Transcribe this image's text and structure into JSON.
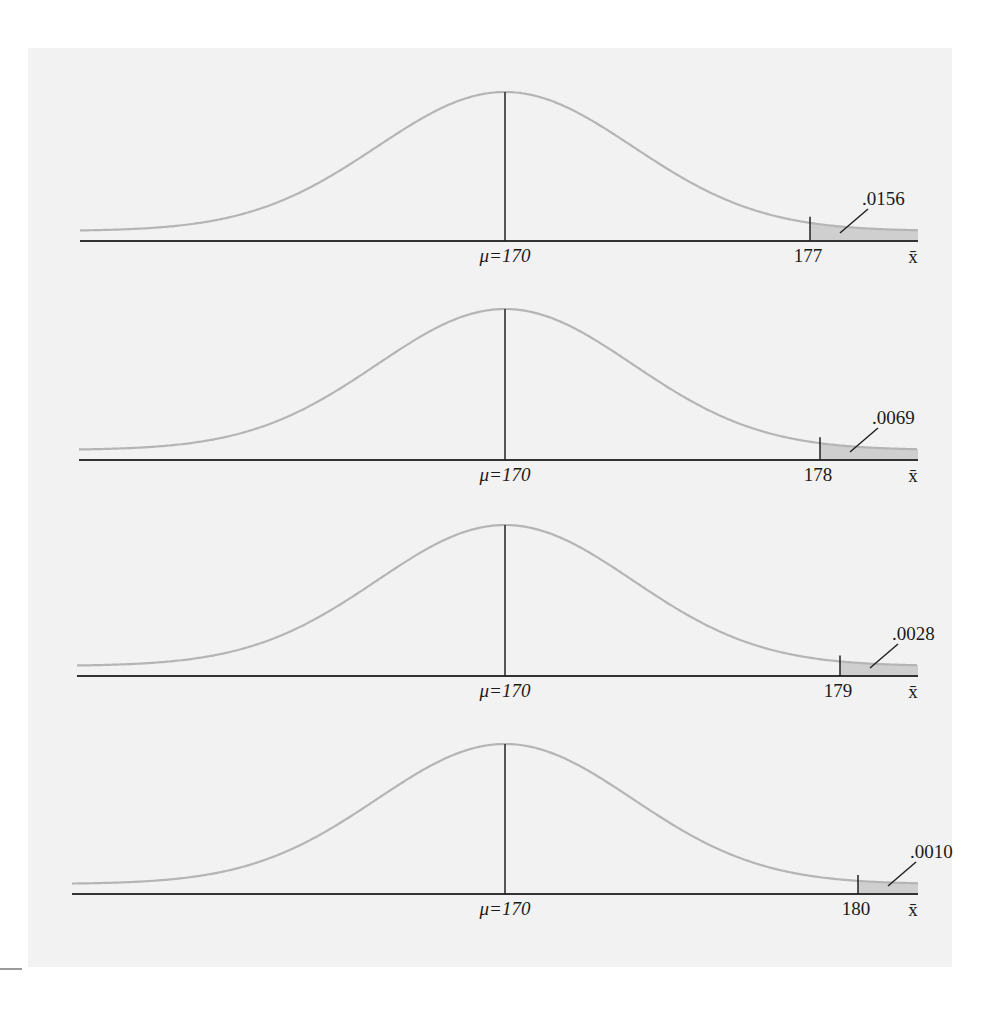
{
  "chart_data": [
    {
      "type": "area",
      "title": "",
      "distribution": "normal",
      "mean": 170,
      "mean_label": "μ=170",
      "cutoff": 177,
      "cutoff_label": "177",
      "tail_probability": ".0156",
      "xlabel": "x̄",
      "shaded_region": "right tail, x̄ > 177"
    },
    {
      "type": "area",
      "title": "",
      "distribution": "normal",
      "mean": 170,
      "mean_label": "μ=170",
      "cutoff": 178,
      "cutoff_label": "178",
      "tail_probability": ".0069",
      "xlabel": "x̄",
      "shaded_region": "right tail, x̄ > 178"
    },
    {
      "type": "area",
      "title": "",
      "distribution": "normal",
      "mean": 170,
      "mean_label": "μ=170",
      "cutoff": 179,
      "cutoff_label": "179",
      "tail_probability": ".0028",
      "xlabel": "x̄",
      "shaded_region": "right tail, x̄ > 179"
    },
    {
      "type": "area",
      "title": "",
      "distribution": "normal",
      "mean": 170,
      "mean_label": "μ=170",
      "cutoff": 180,
      "cutoff_label": "180",
      "tail_probability": ".0010",
      "xlabel": "x̄",
      "shaded_region": "right tail, x̄ > 180"
    }
  ],
  "colors": {
    "background_panel": "#f2f2f2",
    "curve": "#b5b5b5",
    "axis": "#333333",
    "shade": "#cfcfcf",
    "text": "#1a1a1a"
  },
  "panels": [
    {
      "axis_y": 241,
      "peak_y": 92,
      "axis_x0": 80,
      "cutoff_x": 810,
      "mean_label": "μ=170",
      "cutoff_label": "177",
      "prob_label": ".0156",
      "xbar_label": "x̄"
    },
    {
      "axis_y": 460,
      "peak_y": 309,
      "axis_x0": 79,
      "cutoff_x": 820,
      "mean_label": "μ=170",
      "cutoff_label": "178",
      "prob_label": ".0069",
      "xbar_label": "x̄"
    },
    {
      "axis_y": 676,
      "peak_y": 525,
      "axis_x0": 77,
      "cutoff_x": 840,
      "mean_label": "μ=170",
      "cutoff_label": "179",
      "prob_label": ".0028",
      "xbar_label": "x̄"
    },
    {
      "axis_y": 894,
      "peak_y": 744,
      "axis_x0": 72,
      "cutoff_x": 858,
      "mean_label": "μ=170",
      "cutoff_label": "180",
      "prob_label": ".0010",
      "xbar_label": "x̄"
    }
  ]
}
